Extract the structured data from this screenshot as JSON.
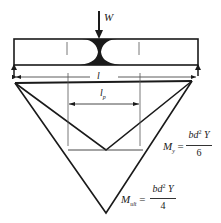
{
  "diagram": {
    "load": {
      "label": "W",
      "icon": "downward-arrow-icon"
    },
    "beam": {
      "span_label": "l",
      "plastic_zone": "hourglass-shaded-region"
    },
    "plastic_length": {
      "label": "l",
      "subscript": "p"
    },
    "moments": {
      "yield": {
        "symbol": "M",
        "subscript": "y",
        "equals": "=",
        "numerator_main": "bd",
        "numerator_exp": "2",
        "numerator_tail": " Y",
        "denominator": "6"
      },
      "ultimate": {
        "symbol": "M",
        "subscript": "ult",
        "equals": "=",
        "numerator_main": "bd",
        "numerator_exp": "2",
        "numerator_tail": " Y",
        "denominator": "4"
      }
    },
    "colors": {
      "ink": "#1a1a1a",
      "background": "#ffffff"
    }
  }
}
